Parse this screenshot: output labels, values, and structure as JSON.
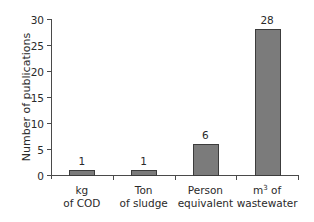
{
  "chart_data": {
    "type": "bar",
    "title": "",
    "xlabel": "",
    "ylabel": "Number of publications",
    "categories": [
      "kg of COD",
      "Ton of sludge",
      "Person equivalent",
      "m3 of wastewater"
    ],
    "category_lines": [
      [
        "kg",
        "of COD"
      ],
      [
        "Ton",
        "of sludge"
      ],
      [
        "Person",
        "equivalent"
      ],
      [
        "m3 of",
        "wastewater"
      ]
    ],
    "values": [
      1,
      1,
      6,
      28
    ],
    "data_labels": [
      "1",
      "1",
      "6",
      "28"
    ],
    "ylim": [
      0,
      30
    ],
    "yticks": [
      0,
      5,
      10,
      15,
      20,
      25,
      30
    ],
    "grid": false,
    "legend": null,
    "colors": {
      "bar_fill": "#7b7b7b",
      "bar_stroke": "#3c3c3c",
      "axis": "#4a4a4a",
      "text": "#2a2a2a"
    }
  }
}
